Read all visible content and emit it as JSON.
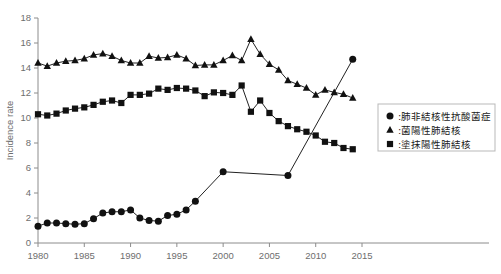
{
  "chart_data": {
    "type": "line",
    "title": "",
    "xlabel": "",
    "ylabel": "Incidence rate",
    "xlim": [
      1980,
      2015
    ],
    "ylim": [
      0,
      18
    ],
    "ytick_step": 2,
    "xtick_step": 5,
    "grid": false,
    "legend_position": "right",
    "yticks": [
      "0",
      "2",
      "4",
      "6",
      "8",
      "10",
      "12",
      "14",
      "16",
      "18"
    ],
    "xticks": [
      "1980",
      "1985",
      "1990",
      "1995",
      "2000",
      "2005",
      "2010",
      "2015"
    ],
    "series": [
      {
        "name": "肺非結核性抗酸菌症",
        "marker": "circle",
        "color": "#111111",
        "x": [
          1980,
          1981,
          1982,
          1983,
          1984,
          1985,
          1986,
          1987,
          1988,
          1989,
          1990,
          1991,
          1992,
          1993,
          1994,
          1995,
          1996,
          1997,
          2000,
          2007,
          2014
        ],
        "values": [
          1.35,
          1.6,
          1.6,
          1.55,
          1.5,
          1.55,
          1.95,
          2.4,
          2.5,
          2.5,
          2.65,
          2.0,
          1.8,
          1.75,
          2.2,
          2.3,
          2.65,
          3.35,
          5.7,
          5.4,
          14.7
        ]
      },
      {
        "name": "菌陽性肺結核",
        "marker": "triangle",
        "color": "#111111",
        "x": [
          1980,
          1981,
          1982,
          1983,
          1984,
          1985,
          1986,
          1987,
          1988,
          1989,
          1990,
          1991,
          1992,
          1993,
          1994,
          1995,
          1996,
          1997,
          1998,
          1999,
          2000,
          2001,
          2002,
          2003,
          2004,
          2005,
          2006,
          2007,
          2008,
          2009,
          2010,
          2011,
          2012,
          2013,
          2014
        ],
        "values": [
          14.4,
          14.15,
          14.4,
          14.55,
          14.6,
          14.75,
          15.05,
          15.15,
          14.95,
          14.6,
          14.4,
          14.4,
          14.95,
          14.8,
          14.85,
          15.05,
          14.75,
          14.2,
          14.25,
          14.25,
          14.6,
          15.0,
          14.6,
          16.3,
          15.1,
          14.3,
          13.85,
          13.0,
          12.7,
          12.4,
          11.85,
          12.25,
          12.05,
          11.9,
          11.6
        ]
      },
      {
        "name": "塗抹陽性肺結核",
        "marker": "square",
        "color": "#111111",
        "x": [
          1980,
          1981,
          1982,
          1983,
          1984,
          1985,
          1986,
          1987,
          1988,
          1989,
          1990,
          1991,
          1992,
          1993,
          1994,
          1995,
          1996,
          1997,
          1998,
          1999,
          2000,
          2001,
          2002,
          2003,
          2004,
          2005,
          2006,
          2007,
          2008,
          2009,
          2010,
          2011,
          2012,
          2013,
          2014
        ],
        "values": [
          10.3,
          10.2,
          10.35,
          10.6,
          10.75,
          10.85,
          11.05,
          11.3,
          11.4,
          11.2,
          11.85,
          11.85,
          11.95,
          12.35,
          12.25,
          12.4,
          12.35,
          12.2,
          11.75,
          12.05,
          12.0,
          11.85,
          12.6,
          10.5,
          11.4,
          10.4,
          9.75,
          9.35,
          9.1,
          8.9,
          8.6,
          8.1,
          8.0,
          7.6,
          7.5
        ]
      }
    ],
    "series_tail": [
      {
        "name": "菌陽性肺結核",
        "marker": "triangle",
        "x": [
          2003,
          2004,
          2005,
          2006,
          2007,
          2008,
          2009,
          2010,
          2011,
          2012,
          2013,
          2014
        ],
        "values": [
          16.3,
          15.1,
          14.3,
          13.85,
          13.0,
          12.7,
          12.4,
          11.85,
          12.25,
          12.05,
          11.9,
          11.6
        ]
      }
    ]
  },
  "legend": {
    "entries": [
      {
        "marker": "circle",
        "separator": ":",
        "label": "肺非結核性抗酸菌症"
      },
      {
        "marker": "triangle",
        "separator": ":",
        "label": "菌陽性肺結核"
      },
      {
        "marker": "square",
        "separator": ":",
        "label": "塗抹陽性肺結核"
      }
    ]
  },
  "colors": {
    "axis": "#8c8c8c",
    "tick_text": "#6e6e6e",
    "marker": "#111111",
    "legend_border": "#b9b9b9",
    "background": "#ffffff"
  }
}
